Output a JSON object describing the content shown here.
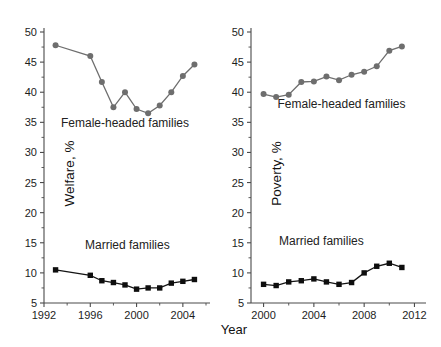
{
  "figure": {
    "xlabel": "Year",
    "colors": {
      "female_headed": "#6e6e6e",
      "married": "#0e0e0e",
      "axis": "#4a4a4a",
      "background": "#ffffff"
    }
  },
  "chart_data": [
    {
      "type": "line",
      "panel": "left",
      "title": "",
      "xlabel": "Year",
      "ylabel": "Welfare, %",
      "xlim": [
        1992,
        2006
      ],
      "ylim": [
        5,
        50
      ],
      "ytick_labels": [
        "5",
        "10",
        "15",
        "20",
        "25",
        "30",
        "35",
        "40",
        "45",
        "50"
      ],
      "yticks": [
        5,
        10,
        15,
        20,
        25,
        30,
        35,
        40,
        45,
        50
      ],
      "xtick_labels": [
        "1992",
        "1996",
        "2000",
        "2004"
      ],
      "xticks": [
        1992,
        1996,
        2000,
        2004
      ],
      "xminor_ticks": [
        1994,
        1998,
        2002,
        2006
      ],
      "grid": false,
      "legend": "inline-annotations",
      "x": [
        1993,
        1996,
        1997,
        1998,
        1999,
        2000,
        2001,
        2002,
        2003,
        2004,
        2005
      ],
      "series": [
        {
          "name": "Female-headed families",
          "marker": "circle",
          "color": "#6e6e6e",
          "values": [
            47.8,
            46.0,
            41.7,
            37.5,
            40.0,
            37.2,
            36.5,
            37.8,
            40.0,
            42.7,
            44.6
          ]
        },
        {
          "name": "Married families",
          "marker": "square",
          "color": "#0e0e0e",
          "values": [
            10.5,
            9.6,
            8.7,
            8.4,
            8.0,
            7.3,
            7.5,
            7.5,
            8.3,
            8.6,
            8.9
          ]
        }
      ],
      "annotations": [
        {
          "text": "Female-headed families",
          "x": 1999.0,
          "y": 34.2
        },
        {
          "text": "Married families",
          "x": 1999.2,
          "y": 14.0
        }
      ]
    },
    {
      "type": "line",
      "panel": "right",
      "title": "",
      "xlabel": "Year",
      "ylabel": "Poverty, %",
      "xlim": [
        1999,
        2012.6
      ],
      "ylim": [
        5,
        50
      ],
      "ytick_labels": [
        "5",
        "10",
        "15",
        "20",
        "25",
        "30",
        "35",
        "40",
        "45",
        "50"
      ],
      "yticks": [
        5,
        10,
        15,
        20,
        25,
        30,
        35,
        40,
        45,
        50
      ],
      "xtick_labels": [
        "2000",
        "2004",
        "2008",
        "2012"
      ],
      "xticks": [
        2000,
        2004,
        2008,
        2012
      ],
      "xminor_ticks": [
        2002,
        2006,
        2010
      ],
      "grid": false,
      "legend": "inline-annotations",
      "x": [
        2000,
        2001,
        2002,
        2003,
        2004,
        2005,
        2006,
        2007,
        2008,
        2009,
        2010,
        2011
      ],
      "series": [
        {
          "name": "Female-headed families",
          "marker": "circle",
          "color": "#6e6e6e",
          "values": [
            39.7,
            39.2,
            39.6,
            41.7,
            41.8,
            42.6,
            42.0,
            42.9,
            43.4,
            44.3,
            46.9,
            47.6
          ]
        },
        {
          "name": "Married families",
          "marker": "square",
          "color": "#0e0e0e",
          "values": [
            8.1,
            7.9,
            8.5,
            8.7,
            9.0,
            8.5,
            8.1,
            8.4,
            10.0,
            11.1,
            11.6,
            10.9
          ]
        }
      ],
      "annotations": [
        {
          "text": "Female-headed families",
          "x": 2006.2,
          "y": 37.4
        },
        {
          "text": "Married families",
          "x": 2004.6,
          "y": 14.6
        }
      ]
    }
  ]
}
